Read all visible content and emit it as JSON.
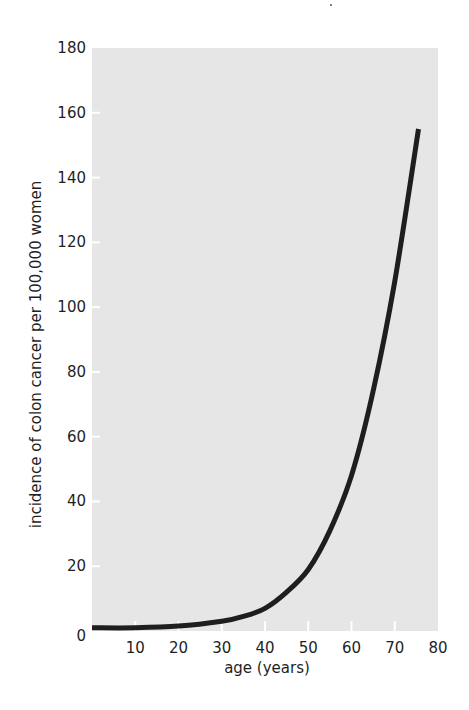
{
  "chart_data": {
    "type": "line",
    "title": "",
    "xlabel": "age (years)",
    "ylabel": "incidence of colon cancer per 100,000 women",
    "xlim": [
      0,
      80
    ],
    "ylim": [
      0,
      180
    ],
    "grid": false,
    "legend": null,
    "x_ticks": [
      10,
      20,
      30,
      40,
      50,
      60,
      70,
      80
    ],
    "y_ticks": [
      0,
      20,
      40,
      60,
      80,
      100,
      120,
      140,
      160,
      180
    ],
    "series": [
      {
        "name": "colon cancer incidence",
        "color": "#1e1e1e",
        "x": [
          0,
          10,
          20,
          30,
          35,
          40,
          45,
          50,
          55,
          60,
          65,
          70,
          75.5
        ],
        "y": [
          1,
          1,
          1.5,
          3,
          4.5,
          7,
          12,
          19,
          31,
          48,
          74,
          108,
          155
        ]
      }
    ]
  },
  "style": {
    "plot_background": "#e6e6e6",
    "tick_mark_color": "#ffffff",
    "line_color": "#1e1e1e"
  }
}
